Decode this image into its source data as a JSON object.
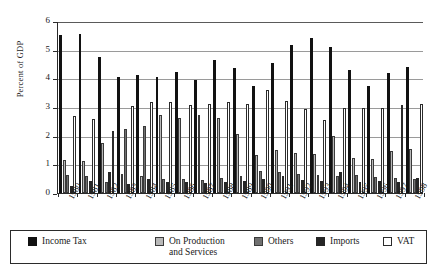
{
  "chart_data": {
    "type": "bar",
    "title": "",
    "xlabel": "",
    "ylabel": "Percent of GDP",
    "ylim": [
      0,
      6
    ],
    "yticks": [
      0,
      1,
      2,
      3,
      4,
      5,
      6
    ],
    "grid": true,
    "legend_position": "bottom",
    "categories": [
      "1980",
      "1981",
      "1982",
      "1983",
      "1984",
      "1985",
      "1986",
      "1987",
      "1988",
      "1989",
      "1990",
      "1991",
      "1992",
      "1993",
      "1994",
      "1995",
      "1996",
      "1997",
      "1998"
    ],
    "series": [
      {
        "name": "Income Tax",
        "color": "#121212",
        "values": [
          5.52,
          5.53,
          4.73,
          4.05,
          4.12,
          4.05,
          4.22,
          3.93,
          4.65,
          4.35,
          3.72,
          4.55,
          5.17,
          5.42,
          5.08,
          4.3,
          3.75,
          4.2,
          4.38
        ]
      },
      {
        "name": "On Production and Services",
        "color": "#b9b9b9",
        "values": [
          1.15,
          1.12,
          1.75,
          0.65,
          0.6,
          2.73,
          2.62,
          2.72,
          2.6,
          2.05,
          1.32,
          1.5,
          1.38,
          1.35,
          1.98,
          1.22,
          1.18,
          1.45,
          1.55
        ]
      },
      {
        "name": "Others",
        "color": "#707070",
        "values": [
          0.62,
          0.6,
          0.38,
          2.22,
          2.35,
          0.48,
          0.5,
          0.45,
          0.52,
          0.58,
          0.78,
          0.75,
          0.68,
          0.62,
          0.58,
          0.62,
          0.55,
          0.52,
          0.5
        ]
      },
      {
        "name": "Imports",
        "color": "#262626",
        "values": [
          0.25,
          0.42,
          0.72,
          0.32,
          0.5,
          0.38,
          0.4,
          0.35,
          0.38,
          0.42,
          0.48,
          0.58,
          0.45,
          0.42,
          0.72,
          0.38,
          0.42,
          0.4,
          0.52
        ]
      },
      {
        "name": "VAT",
        "color": "#ffffff",
        "values": [
          2.68,
          2.58,
          2.18,
          3.02,
          3.17,
          3.18,
          3.08,
          3.12,
          3.18,
          3.12,
          3.6,
          3.22,
          2.92,
          2.55,
          2.95,
          2.98,
          2.95,
          3.08,
          3.12
        ]
      }
    ]
  },
  "axis": {
    "ylabel": "Percent of GDP"
  },
  "legend": {
    "items": [
      {
        "label": "Income Tax",
        "swatch": "black-swatch"
      },
      {
        "label": "On Production and Services",
        "swatch": "light-gray-swatch"
      },
      {
        "label": "Others",
        "swatch": "medium-gray-swatch"
      },
      {
        "label": "Imports",
        "swatch": "dark-gray-swatch"
      },
      {
        "label": "VAT",
        "swatch": "white-swatch"
      }
    ]
  }
}
